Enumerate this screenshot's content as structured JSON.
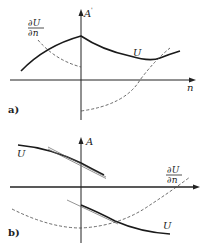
{
  "panels": [
    {
      "id": "a",
      "panel_label": "a)",
      "y_axis_label": "A",
      "y_axis_label_prime": "'",
      "x_axis_label": "n",
      "curves": [
        {
          "name": "U",
          "label": "U",
          "style": "solid",
          "description": "rises to a cusp at the interface n=0, then decays toward a minimum and rises again"
        },
        {
          "name": "dU/dn",
          "label_num": "∂U",
          "label_den": "∂n",
          "style": "dashed",
          "description": "derivative jumps from positive (left) to negative (right) at the interface, crosses zero near the minimum of U"
        }
      ]
    },
    {
      "id": "b",
      "panel_label": "b)",
      "y_axis_label": "A",
      "x_axis_label": "",
      "curves": [
        {
          "name": "U-left",
          "label": "U",
          "style": "solid",
          "description": "positive branch above the axis decreasing toward the interface"
        },
        {
          "name": "U-right",
          "label": "U",
          "style": "solid",
          "description": "negative branch below the axis decreasing away from the interface"
        },
        {
          "name": "dU/dn",
          "label_num": "∂U",
          "label_den": "∂n",
          "style": "dashed",
          "description": "continuous derivative, minimum at the interface, rising to cross the axis on the right"
        }
      ],
      "tangents": 2
    }
  ]
}
